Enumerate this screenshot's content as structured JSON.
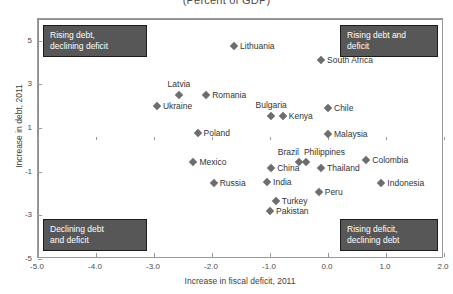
{
  "chart_data": {
    "type": "scatter",
    "title": "(Percent of GDP)",
    "xlabel": "Increase in fiscal deficit, 2011",
    "ylabel": "Increase in debt, 2011",
    "xlim": [
      -5.0,
      2.0
    ],
    "ylim": [
      -5.0,
      6.0
    ],
    "xticks": [
      "-5.0",
      "-4.0",
      "-3.0",
      "-2.0",
      "-1.0",
      "0.0",
      "1.0",
      "2.0"
    ],
    "xtick_values": [
      -5.0,
      -4.0,
      -3.0,
      -2.0,
      -1.0,
      0.0,
      1.0,
      2.0
    ],
    "yticks": [
      "5",
      "3",
      "1",
      "-1",
      "-3",
      "-5"
    ],
    "ytick_values": [
      5,
      3,
      1,
      -1,
      -3,
      -5
    ],
    "grid": false,
    "legend": "none",
    "points": [
      {
        "name": "Lithuania",
        "x": -1.62,
        "y": 4.78,
        "label_pos": "right"
      },
      {
        "name": "South Africa",
        "x": -0.12,
        "y": 4.1,
        "label_pos": "right"
      },
      {
        "name": "Latvia",
        "x": -2.57,
        "y": 2.52,
        "label_pos": "above"
      },
      {
        "name": "Romania",
        "x": -2.1,
        "y": 2.52,
        "label_pos": "right"
      },
      {
        "name": "Ukraine",
        "x": -2.95,
        "y": 2.02,
        "label_pos": "right"
      },
      {
        "name": "Bulgaria",
        "x": -0.98,
        "y": 1.56,
        "label_pos": "above"
      },
      {
        "name": "Kenya",
        "x": -0.78,
        "y": 1.56,
        "label_pos": "right"
      },
      {
        "name": "Chile",
        "x": 0.0,
        "y": 1.93,
        "label_pos": "right"
      },
      {
        "name": "Malaysia",
        "x": 0.0,
        "y": 0.75,
        "label_pos": "right"
      },
      {
        "name": "Poland",
        "x": -2.25,
        "y": 0.77,
        "label_pos": "right"
      },
      {
        "name": "Mexico",
        "x": -2.32,
        "y": -0.55,
        "label_pos": "right"
      },
      {
        "name": "Brazil",
        "x": -0.5,
        "y": -0.55,
        "label_pos": "above-left"
      },
      {
        "name": "Philippines",
        "x": -0.38,
        "y": -0.55,
        "label_pos": "above-right"
      },
      {
        "name": "China",
        "x": -0.98,
        "y": -0.83,
        "label_pos": "right"
      },
      {
        "name": "Thailand",
        "x": -0.12,
        "y": -0.85,
        "label_pos": "right"
      },
      {
        "name": "Colombia",
        "x": 0.66,
        "y": -0.45,
        "label_pos": "right"
      },
      {
        "name": "Russia",
        "x": -1.97,
        "y": -1.53,
        "label_pos": "right"
      },
      {
        "name": "India",
        "x": -1.05,
        "y": -1.48,
        "label_pos": "right"
      },
      {
        "name": "Indonesia",
        "x": 0.92,
        "y": -1.5,
        "label_pos": "right"
      },
      {
        "name": "Peru",
        "x": -0.16,
        "y": -1.92,
        "label_pos": "right"
      },
      {
        "name": "Turkey",
        "x": -0.9,
        "y": -2.35,
        "label_pos": "right"
      },
      {
        "name": "Pakistan",
        "x": -1.0,
        "y": -2.8,
        "label_pos": "right"
      }
    ],
    "annotations": {
      "top_left": "Rising debt,\ndeclining deficit",
      "top_right": "Rising debt and\ndeficit",
      "bottom_left": "Declining debt\nand deficit",
      "bottom_right": "Rising deficit,\ndeclining debt"
    },
    "colors": {
      "marker": "#6d6d6d",
      "frame": "#9a9a9a",
      "annotation_bg": "#575757",
      "annotation_text": "#ffffff",
      "text": "#333333"
    }
  }
}
